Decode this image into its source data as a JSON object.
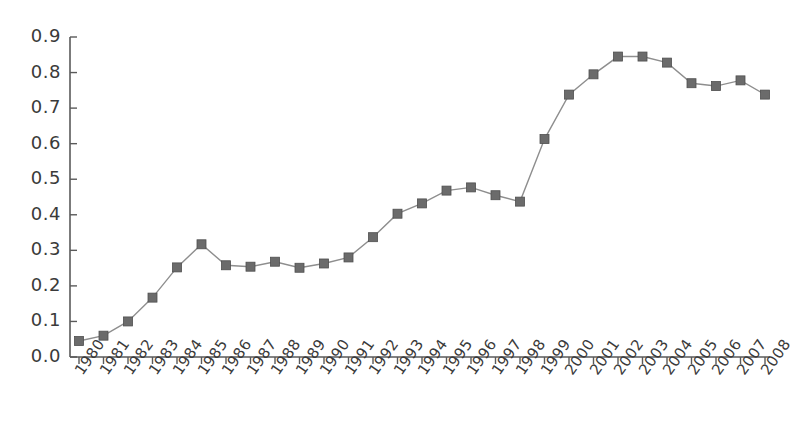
{
  "chart_data": {
    "type": "line",
    "title": "",
    "subtitle": "",
    "xlabel": "",
    "ylabel": "",
    "legend": [],
    "legend_position": "none",
    "grid": false,
    "xlim": [
      1980,
      2008
    ],
    "ylim": [
      0.0,
      0.9
    ],
    "ytick_labels": [
      "0.0",
      "0.1",
      "0.2",
      "0.3",
      "0.4",
      "0.5",
      "0.6",
      "0.7",
      "0.8",
      "0.9"
    ],
    "ytick_values": [
      0.0,
      0.1,
      0.2,
      0.3,
      0.4,
      0.5,
      0.6,
      0.7,
      0.8,
      0.9
    ],
    "categories": [
      "1980",
      "1981",
      "1982",
      "1983",
      "1984",
      "1985",
      "1986",
      "1987",
      "1988",
      "1989",
      "1990",
      "1991",
      "1992",
      "1993",
      "1994",
      "1995",
      "1996",
      "1997",
      "1998",
      "1999",
      "2000",
      "2001",
      "2002",
      "2003",
      "2004",
      "2005",
      "2006",
      "2007",
      "2008"
    ],
    "x": [
      1980,
      1981,
      1982,
      1983,
      1984,
      1985,
      1986,
      1987,
      1988,
      1989,
      1990,
      1991,
      1992,
      1993,
      1994,
      1995,
      1996,
      1997,
      1998,
      1999,
      2000,
      2001,
      2002,
      2003,
      2004,
      2005,
      2006,
      2007,
      2008
    ],
    "values": [
      0.045,
      0.06,
      0.1,
      0.167,
      0.252,
      0.317,
      0.258,
      0.254,
      0.268,
      0.251,
      0.263,
      0.28,
      0.337,
      0.403,
      0.432,
      0.468,
      0.477,
      0.455,
      0.437,
      0.613,
      0.738,
      0.795,
      0.845,
      0.845,
      0.828,
      0.77,
      0.762,
      0.778,
      0.738
    ],
    "marker": "square",
    "marker_color": "#6b6b6b",
    "line_color": "#8e8e8e",
    "axis_color": "#5a5a5a",
    "background_color": "#ffffff"
  },
  "axes": {
    "y_axis_name": "y-axis",
    "x_axis_name": "x-axis"
  }
}
